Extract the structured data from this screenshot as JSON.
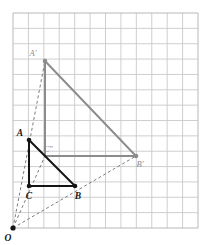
{
  "figure": {
    "grid": {
      "x0": 13,
      "y0": 13,
      "x1": 198,
      "y1": 228,
      "columns": 12,
      "rows": 14,
      "cell_size": 15.4,
      "line_color": "#c9c9c9",
      "border_color": "#b8b8b8",
      "visible": true
    },
    "colors": {
      "preimage_stroke": "#141414",
      "image_stroke": "#8c8c8c",
      "ray_stroke": "#6e6e6e",
      "label_dark": "#141414",
      "label_gray": "#8a8a8a",
      "background": "#ffffff"
    },
    "center": {
      "name": "O",
      "label": "O",
      "x": 13,
      "y": 228,
      "label_x": 8,
      "label_y": 241,
      "dot": true,
      "color": "#141414"
    },
    "preimage": {
      "name": "triangle-ABC",
      "stroke": "#141414",
      "stroke_width": 2,
      "points": [
        {
          "name": "A",
          "label": "A",
          "x": 29,
          "y": 140,
          "label_x": 20,
          "label_y": 136,
          "dot": true
        },
        {
          "name": "C",
          "label": "C",
          "x": 29,
          "y": 186,
          "label_x": 29,
          "label_y": 199,
          "dot": true
        },
        {
          "name": "B",
          "label": "B",
          "x": 75,
          "y": 186,
          "label_x": 78,
          "label_y": 199,
          "dot": true
        }
      ],
      "path": "M 29 140 L 29 186 L 75 186 Z"
    },
    "image": {
      "name": "triangle-A-prime-C-prime-B-prime",
      "stroke": "#8c8c8c",
      "stroke_width": 2,
      "points": [
        {
          "name": "A-prime",
          "label": "A′",
          "x": 45,
          "y": 61,
          "label_x": 33,
          "label_y": 56,
          "dot": true
        },
        {
          "name": "C-prime",
          "label": "C″",
          "x": 45,
          "y": 156,
          "label_x": 48,
          "label_y": 152,
          "dot": false
        },
        {
          "name": "B-prime",
          "label": "B′",
          "x": 136,
          "y": 156,
          "label_x": 140,
          "label_y": 167,
          "dot": true
        }
      ],
      "path": "M 45 61 L 45 156 L 136 156 Z"
    },
    "rays": [
      {
        "name": "ray-O-to-A-prime",
        "x1": 13,
        "y1": 228,
        "x2": 45,
        "y2": 61,
        "dash": "3,2.5"
      },
      {
        "name": "ray-O-to-C-prime",
        "x1": 13,
        "y1": 228,
        "x2": 45,
        "y2": 156,
        "dash": "3,2.5"
      },
      {
        "name": "ray-O-to-B-prime",
        "x1": 13,
        "y1": 228,
        "x2": 136,
        "y2": 156,
        "dash": "3,2.5"
      }
    ]
  }
}
